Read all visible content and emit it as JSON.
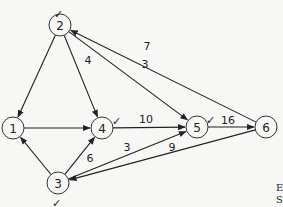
{
  "diagram": {
    "type": "directed-weighted-graph",
    "nodes": [
      {
        "id": "1",
        "label": "1",
        "x": 13,
        "y": 128,
        "checked": false
      },
      {
        "id": "2",
        "label": "2",
        "x": 60,
        "y": 25,
        "checked": true
      },
      {
        "id": "3",
        "label": "3",
        "x": 58,
        "y": 183,
        "checked": true
      },
      {
        "id": "4",
        "label": "4",
        "x": 102,
        "y": 128,
        "checked": true
      },
      {
        "id": "5",
        "label": "5",
        "x": 197,
        "y": 127,
        "checked": true
      },
      {
        "id": "6",
        "label": "6",
        "x": 266,
        "y": 127,
        "checked": false
      }
    ],
    "edges": [
      {
        "from": "2",
        "to": "1",
        "weight": ""
      },
      {
        "from": "2",
        "to": "4",
        "weight": "4"
      },
      {
        "from": "1",
        "to": "4",
        "weight": ""
      },
      {
        "from": "6",
        "to": "2",
        "weight": "7"
      },
      {
        "from": "2",
        "to": "5",
        "weight": "3"
      },
      {
        "from": "4",
        "to": "5",
        "weight": "10"
      },
      {
        "from": "5",
        "to": "6",
        "weight": "16"
      },
      {
        "from": "3",
        "to": "1",
        "weight": ""
      },
      {
        "from": "3",
        "to": "4",
        "weight": "6"
      },
      {
        "from": "3",
        "to": "5",
        "weight": "3"
      },
      {
        "from": "6",
        "to": "3",
        "weight": "9"
      }
    ],
    "check_mark": "✓",
    "caption_fragment": [
      "E",
      "S"
    ]
  }
}
